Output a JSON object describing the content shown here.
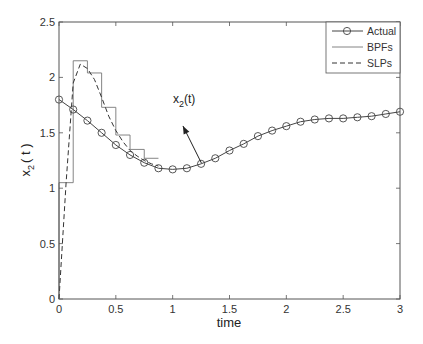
{
  "chart_data": {
    "type": "line",
    "title": "",
    "xlabel": "time",
    "ylabel": "x_2 ( t )",
    "ylabel_main": "x",
    "ylabel_sub": "2",
    "ylabel_tail": "( t )",
    "xlim": [
      0,
      3
    ],
    "ylim": [
      0,
      2.5
    ],
    "grid": false,
    "legend_position": "upper right",
    "x_ticks": [
      0,
      0.5,
      1,
      1.5,
      2,
      2.5,
      3
    ],
    "x_tick_labels": [
      "0",
      "0.5",
      "1",
      "1.5",
      "2",
      "2.5",
      "3"
    ],
    "y_ticks": [
      0,
      0.5,
      1,
      1.5,
      2,
      2.5
    ],
    "y_tick_labels": [
      "0",
      "0.5",
      "1",
      "1.5",
      "2",
      "2.5"
    ],
    "legend": [
      "Actual",
      "BPFs",
      "SLPs"
    ],
    "annotation": {
      "text_main": "x",
      "text_sub": "2",
      "text_tail": "(t)",
      "arrow_from": [
        1.02,
        1.67
      ],
      "arrow_to": [
        1.2,
        1.2
      ]
    },
    "series": [
      {
        "name": "Actual",
        "style": "solid-circle-markers",
        "x": [
          0,
          0.125,
          0.25,
          0.375,
          0.5,
          0.625,
          0.75,
          0.875,
          1.0,
          1.125,
          1.25,
          1.375,
          1.5,
          1.625,
          1.75,
          1.875,
          2.0,
          2.125,
          2.25,
          2.375,
          2.5,
          2.625,
          2.75,
          2.875,
          3.0
        ],
        "values": [
          1.8,
          1.71,
          1.61,
          1.5,
          1.39,
          1.3,
          1.23,
          1.18,
          1.17,
          1.18,
          1.22,
          1.27,
          1.34,
          1.4,
          1.47,
          1.52,
          1.56,
          1.6,
          1.62,
          1.63,
          1.63,
          1.64,
          1.65,
          1.67,
          1.69
        ]
      },
      {
        "name": "BPFs",
        "style": "step-thin-solid",
        "x_edges": [
          0,
          0.125,
          0.25,
          0.375,
          0.5,
          0.625,
          0.75,
          0.875
        ],
        "values": [
          1.05,
          2.15,
          2.04,
          1.73,
          1.48,
          1.35,
          1.27
        ]
      },
      {
        "name": "SLPs",
        "style": "dashed",
        "x": [
          0,
          0.0625,
          0.125,
          0.1875,
          0.25,
          0.3125,
          0.375,
          0.4375,
          0.5,
          0.5625,
          0.625,
          0.6875,
          0.75,
          0.8125,
          0.875
        ],
        "values": [
          0.0,
          1.05,
          1.95,
          2.12,
          2.08,
          1.98,
          1.82,
          1.65,
          1.52,
          1.42,
          1.34,
          1.29,
          1.25,
          1.22,
          1.2
        ]
      }
    ]
  },
  "colors": {
    "axes": "#555555",
    "actual": "#444444",
    "bpf": "#777777",
    "slp": "#333333",
    "background": "#ffffff"
  }
}
